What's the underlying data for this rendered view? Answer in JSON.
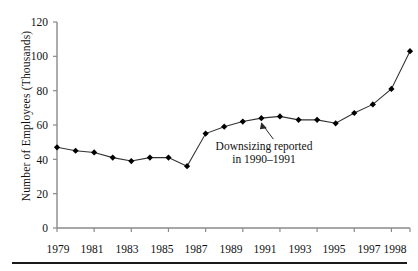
{
  "chart_data": {
    "type": "line",
    "title": "",
    "xlabel": "",
    "ylabel": "Number of Employees (Thousands)",
    "x": [
      1979,
      1980,
      1981,
      1982,
      1983,
      1984,
      1985,
      1986,
      1987,
      1988,
      1989,
      1990,
      1991,
      1992,
      1993,
      1994,
      1995,
      1996,
      1997,
      1998
    ],
    "values": [
      47,
      45,
      44,
      41,
      39,
      41,
      41,
      36,
      55,
      59,
      62,
      64,
      65,
      63,
      63,
      61,
      67,
      72,
      81,
      103
    ],
    "xlim": [
      1979,
      1998
    ],
    "ylim": [
      0,
      120
    ],
    "xticks": [
      1979,
      1981,
      1983,
      1985,
      1987,
      1989,
      1991,
      1993,
      1995,
      1997,
      1998
    ],
    "xtick_labels": [
      "1979",
      "1981",
      "1983",
      "1985",
      "1987",
      "1989",
      "1991",
      "1993",
      "1995",
      "1997",
      "1998"
    ],
    "yticks": [
      0,
      20,
      40,
      60,
      80,
      100,
      120
    ],
    "ytick_labels": [
      "0",
      "20",
      "40",
      "60",
      "80",
      "100",
      "120"
    ],
    "grid": false,
    "legend": null,
    "marker": "diamond",
    "line_color": "#333333",
    "marker_color": "#000000",
    "annotations": [
      {
        "name": "downsizing-note",
        "line1": "Downsizing reported",
        "line2": "in 1990–1991",
        "points_to_year": 1990,
        "points_to_value": 64
      }
    ]
  },
  "axis": {
    "y_label": "Number of Employees (Thousands)"
  }
}
